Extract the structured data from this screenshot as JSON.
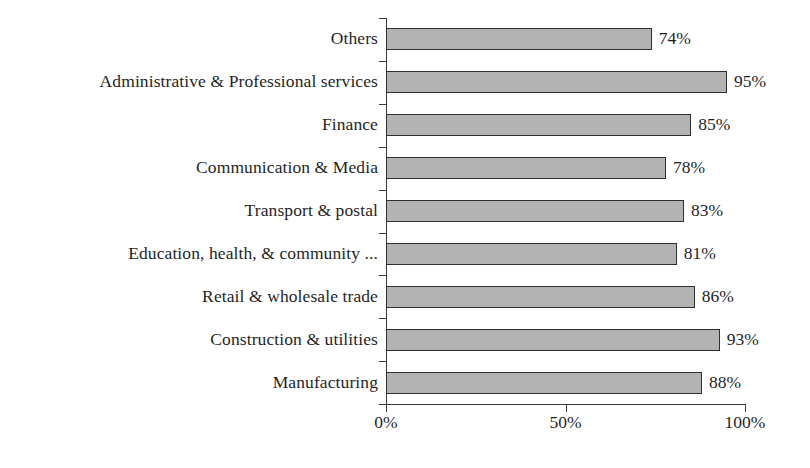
{
  "chart_data": {
    "type": "bar",
    "orientation": "horizontal",
    "title": "",
    "subtitle": "",
    "xlabel": "",
    "ylabel": "",
    "xlim": [
      0,
      100
    ],
    "xticks": [
      "0%",
      "50%",
      "100%"
    ],
    "xtick_values": [
      0,
      50,
      100
    ],
    "grid": false,
    "legend": null,
    "value_label_suffix": "%",
    "categories": [
      "Others",
      "Administrative & Professional services",
      "Finance",
      "Communication & Media",
      "Transport & postal",
      "Education, health, & community ...",
      "Retail & wholesale trade",
      "Construction & utilities",
      "Manufacturing"
    ],
    "values": [
      74,
      95,
      85,
      78,
      83,
      81,
      86,
      93,
      88
    ],
    "value_labels": [
      "74%",
      "95%",
      "85%",
      "78%",
      "83%",
      "81%",
      "86%",
      "93%",
      "88%"
    ],
    "bars": [
      {
        "category": "Others",
        "value": 74,
        "label": "74%"
      },
      {
        "category": "Administrative & Professional services",
        "value": 95,
        "label": "95%"
      },
      {
        "category": "Finance",
        "value": 85,
        "label": "85%"
      },
      {
        "category": "Communication & Media",
        "value": 78,
        "label": "78%"
      },
      {
        "category": "Transport & postal",
        "value": 83,
        "label": "83%"
      },
      {
        "category": "Education, health, & community ...",
        "value": 81,
        "label": "81%"
      },
      {
        "category": "Retail & wholesale trade",
        "value": 86,
        "label": "86%"
      },
      {
        "category": "Construction & utilities",
        "value": 93,
        "label": "93%"
      },
      {
        "category": "Manufacturing",
        "value": 88,
        "label": "88%"
      }
    ],
    "colors": {
      "bar_fill": "#b3b3b3",
      "bar_border": "#2e2e2e",
      "axis": "#3a3a3a",
      "text": "#1f1f1f",
      "background": "#ffffff"
    }
  }
}
